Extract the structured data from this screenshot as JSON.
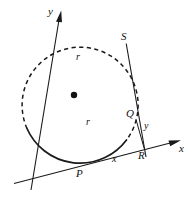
{
  "figure": {
    "type": "geometry-diagram",
    "canvas": {
      "width": 192,
      "height": 201,
      "background": "#ffffff"
    },
    "colors": {
      "stroke": "#1a1a1a",
      "dashed_stroke": "#1a1a1a",
      "label": "#111111",
      "background": "#ffffff"
    },
    "circle": {
      "center": {
        "x": 74,
        "y": 95
      },
      "radius": 58,
      "center_dot_radius": 3.2,
      "solid_arc_note": "lower-left through bottom to upper-right",
      "dashed_arc_note": "upper-left through top to right side"
    },
    "points": [
      {
        "id": "P",
        "label": "P",
        "x": 81,
        "y": 168,
        "label_x": 78,
        "label_y": 171,
        "role": "tangent-point"
      },
      {
        "id": "Q",
        "label": "Q",
        "x": 136,
        "y": 120,
        "label_x": 127,
        "label_y": 111,
        "role": "point-on-circle"
      },
      {
        "id": "R",
        "label": "R",
        "x": 144,
        "y": 148,
        "label_x": 139,
        "label_y": 151,
        "role": "foot-on-x-axis"
      },
      {
        "id": "S",
        "label": "S",
        "x": 126,
        "y": 41,
        "label_x": 122,
        "label_y": 35,
        "role": "point-on-circle"
      },
      {
        "id": "O",
        "label": "",
        "x": 74,
        "y": 95,
        "role": "center"
      }
    ],
    "axes": {
      "x": {
        "label": "x",
        "label_x": 179,
        "label_y": 145,
        "from": {
          "x": 14,
          "y": 183
        },
        "to": {
          "x": 180,
          "y": 140
        },
        "arrow": true
      },
      "y": {
        "label": "y",
        "label_x": 48,
        "label_y": 8,
        "from": {
          "x": 31,
          "y": 190
        },
        "to": {
          "x": 61,
          "y": 11
        },
        "arrow": true
      }
    },
    "segments": [
      {
        "id": "radius-upper",
        "label": "r",
        "label_x": 75,
        "label_y": 54,
        "from": {
          "x": 74,
          "y": 95
        },
        "to": {
          "x": 56,
          "y": 34
        },
        "style": "solid"
      },
      {
        "id": "radius-lower",
        "label": "r",
        "label_x": 85,
        "label_y": 119,
        "from": {
          "x": 74,
          "y": 95
        },
        "to": {
          "x": 81,
          "y": 168
        },
        "style": "solid"
      },
      {
        "id": "chord-SR",
        "label": "",
        "from": {
          "x": 126,
          "y": 44
        },
        "to": {
          "x": 146,
          "y": 157
        },
        "style": "solid"
      },
      {
        "id": "leg-y",
        "label": "y",
        "label_x": 143,
        "label_y": 124,
        "from": {
          "x": 136,
          "y": 120
        },
        "to": {
          "x": 144,
          "y": 148
        },
        "style": "solid"
      },
      {
        "id": "leg-x",
        "label": "x",
        "label_x": 112,
        "label_y": 155,
        "from": {
          "x": 81,
          "y": 168
        },
        "to": {
          "x": 144,
          "y": 148
        },
        "style": "solid"
      }
    ],
    "labels": {
      "r_upper": "r",
      "r_lower": "r",
      "x_axis": "x",
      "y_axis": "y",
      "x_segment": "x",
      "y_segment": "y",
      "point_p": "P",
      "point_q": "Q",
      "point_r": "R",
      "point_s": "S"
    }
  }
}
